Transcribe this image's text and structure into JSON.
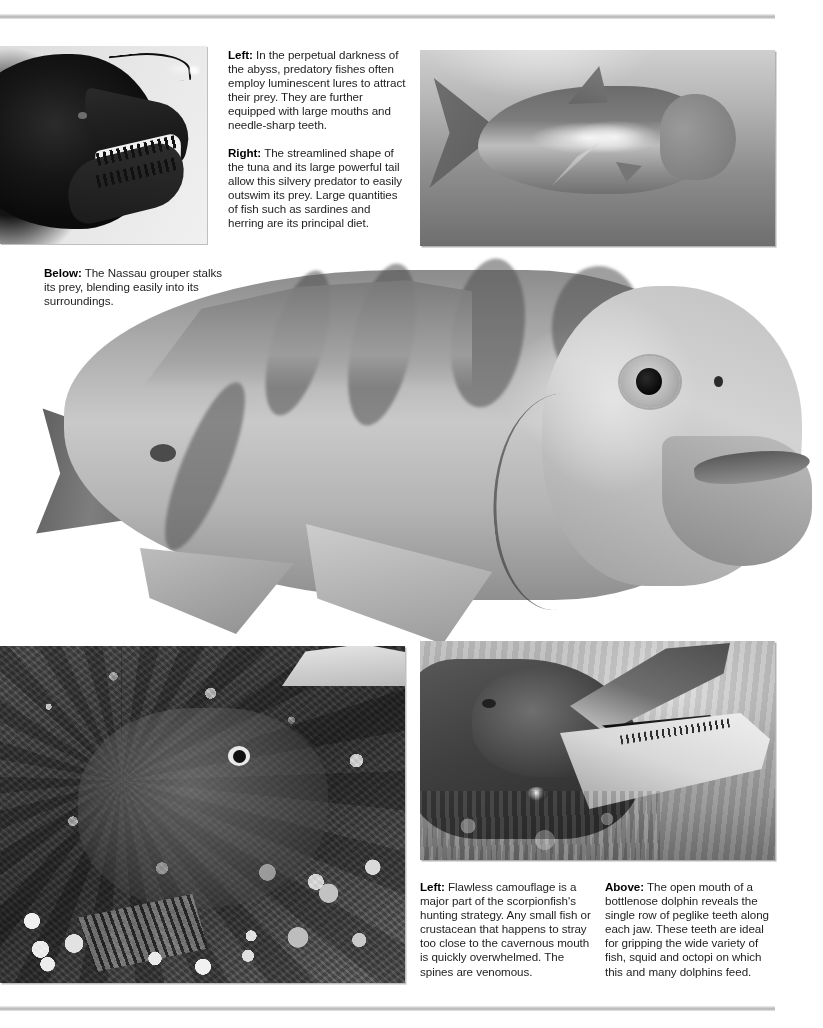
{
  "page": {
    "background_color": "#ffffff",
    "rule_color": "#b4b4b4"
  },
  "captions": {
    "top_left": {
      "paragraphs": [
        {
          "lead": "Left:",
          "text": " In the perpetual darkness of the abyss, predatory fishes often employ luminescent lures to attract their prey. They are further equipped with large mouths and needle-sharp teeth."
        },
        {
          "lead": "Right:",
          "text": " The streamlined shape of the tuna and its large powerful tail allow this silvery predator to easily outswim its prey. Large quantities of fish such as sardines and herring are its principal diet."
        }
      ]
    },
    "below": {
      "lead": "Below:",
      "text": " The Nassau grouper stalks its prey, blending easily into its surroundings."
    },
    "bottom_left": {
      "lead": "Left:",
      "text": " Flawless camouflage is a major part of the scorpionfish's hunting strategy. Any small fish or crustacean that happens to stray too close to the cavernous mouth is quickly overwhelmed. The spines are venomous."
    },
    "bottom_right": {
      "lead": "Above:",
      "text": " The open mouth of a bottlenose dolphin reveals the single row of peglike teeth along each jaw. These teeth are ideal for gripping the wide variety of fish, squid and octopi on which this and many dolphins feed."
    }
  },
  "photos": {
    "anglerfish": {
      "subject": "deep-sea anglerfish with luminescent lure and needle teeth"
    },
    "tuna": {
      "subject": "silvery tuna swimming underwater"
    },
    "grouper": {
      "subject": "Nassau grouper close-up cutout"
    },
    "scorpionfish": {
      "subject": "camouflaged scorpionfish on coral reef"
    },
    "dolphin": {
      "subject": "bottlenose dolphin with open mouth showing peglike teeth"
    }
  }
}
